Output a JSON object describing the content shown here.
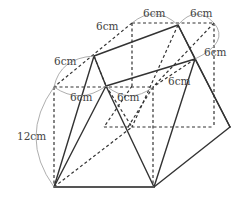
{
  "figure": {
    "type": "solid-geometry",
    "labels": [
      {
        "id": "top-left-segment",
        "text": "6cm"
      },
      {
        "id": "top-right-segment",
        "text": "6cm"
      },
      {
        "id": "left-upper-segment",
        "text": "6cm"
      },
      {
        "id": "right-upper-segment",
        "text": "6cm"
      },
      {
        "id": "front-left-segment",
        "text": "6cm"
      },
      {
        "id": "front-right-segment",
        "text": "6cm"
      },
      {
        "id": "height",
        "text": "12cm"
      }
    ],
    "colors": {
      "line": "#333333",
      "arc": "#999999",
      "text": "#444444",
      "background": "#ffffff"
    }
  }
}
